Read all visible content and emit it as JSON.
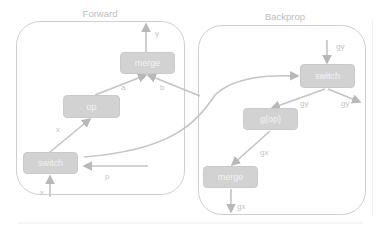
{
  "panels": {
    "forward": {
      "title": "Forward"
    },
    "backprop": {
      "title": "Backprop"
    }
  },
  "forward_nodes": {
    "merge": "merge",
    "op": "op",
    "switch": "switch"
  },
  "forward_edge_labels": {
    "y": "y",
    "a": "a",
    "b": "b",
    "x_op": "x",
    "x_in": "x",
    "p": "p"
  },
  "backprop_nodes": {
    "switch": "switch",
    "gop": "g(op)",
    "merge": "merge"
  },
  "backprop_edge_labels": {
    "gy_in": "gy",
    "gy_left": "gy",
    "gy_right": "gy",
    "gx_mid": "gx",
    "gx_out": "gx"
  },
  "colors": {
    "node_fill": "#d2d2d2",
    "edge": "#c4c4c4",
    "panel_border": "#cfcfcf",
    "text_light": "#f3f3f3"
  }
}
